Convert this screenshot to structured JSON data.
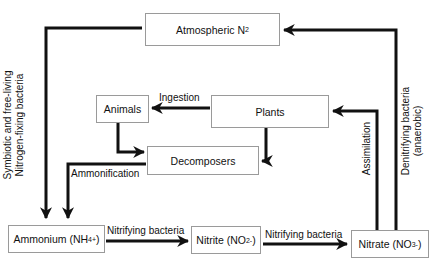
{
  "diagram": {
    "nodes": {
      "atmospheric": {
        "label": "Atmospheric N",
        "sub": "2"
      },
      "animals": {
        "label": "Animals"
      },
      "plants": {
        "label": "Plants"
      },
      "decomposers": {
        "label": "Decomposers"
      },
      "ammonium": {
        "label": "Ammonium (NH",
        "sub": "4",
        "sup": "+",
        "close": ")"
      },
      "nitrite": {
        "label": "Nitrite (NO",
        "sub": "2",
        "sup": "-",
        "close": ")"
      },
      "nitrate": {
        "label": "Nitrate (NO",
        "sub": "3",
        "sup": "-",
        "close": ")"
      }
    },
    "edges": {
      "ingestion": "Ingestion",
      "ammonification": "Ammonification",
      "nitrifying_1": "Nitrifying bacteria",
      "nitrifying_2": "Nitrifying bacteria",
      "assimilation": "Assimilation",
      "fixation_line1": "Symbiotic and free-living",
      "fixation_line2": "Nitrogen-fixing bacteria",
      "denitrifying_line1": "Denitrifying bacteria",
      "denitrifying_line2": "(anaerobic)"
    },
    "stroke_color": "#111111",
    "box_border_color": "#9a9a9a"
  }
}
